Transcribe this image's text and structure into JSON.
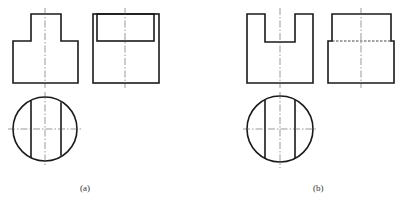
{
  "figure": {
    "panels": [
      {
        "id": "a",
        "label": "(a)",
        "views": [
          "front-view-stepped",
          "side-view-with-top-rectangle",
          "top-view-circle-two-chords"
        ]
      },
      {
        "id": "b",
        "label": "(b)",
        "views": [
          "front-view-notched",
          "side-view-stepped-hidden-line",
          "top-view-circle-two-chords"
        ]
      }
    ],
    "colors": {
      "line": "#1a1a1a",
      "centerline": "#555555",
      "background": "#ffffff"
    }
  }
}
